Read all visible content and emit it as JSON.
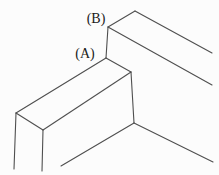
{
  "figure": {
    "background_color": "#fcfcfc",
    "stroke_color": "#4f4f4f",
    "label_color": "#1a1a1a",
    "labels": [
      {
        "text": "(B)",
        "x": 96,
        "y": 23,
        "name": "point-label-B"
      },
      {
        "text": "(A)",
        "x": 85,
        "y": 58,
        "name": "point-label-A"
      }
    ],
    "segments": [
      {
        "name": "upper-slab-back-top-edge",
        "x1": 135,
        "y1": 11,
        "x2": 212,
        "y2": 53
      },
      {
        "name": "upper-slab-left-top-edge",
        "x1": 108,
        "y1": 27,
        "x2": 135,
        "y2": 11
      },
      {
        "name": "upper-slab-front-top-edge",
        "x1": 108,
        "y1": 27,
        "x2": 212,
        "y2": 85
      },
      {
        "name": "edge-B-to-A-vertical",
        "x1": 108,
        "y1": 27,
        "x2": 106,
        "y2": 58
      },
      {
        "name": "lower-slab-back-top-edge",
        "x1": 106,
        "y1": 58,
        "x2": 16,
        "y2": 113
      },
      {
        "name": "lower-slab-right-top-edge",
        "x1": 106,
        "y1": 58,
        "x2": 131,
        "y2": 72
      },
      {
        "name": "lower-slab-left-top-edge",
        "x1": 16,
        "y1": 113,
        "x2": 43,
        "y2": 130
      },
      {
        "name": "lower-slab-front-top-edge",
        "x1": 43,
        "y1": 130,
        "x2": 131,
        "y2": 72
      },
      {
        "name": "lower-slab-back-vertical",
        "x1": 16,
        "y1": 113,
        "x2": 14,
        "y2": 169
      },
      {
        "name": "lower-slab-front-vertical",
        "x1": 43,
        "y1": 130,
        "x2": 42,
        "y2": 171
      },
      {
        "name": "lower-slab-right-vertical",
        "x1": 131,
        "y1": 72,
        "x2": 134,
        "y2": 123
      },
      {
        "name": "floor-edge-left",
        "x1": 134,
        "y1": 123,
        "x2": 61,
        "y2": 166
      },
      {
        "name": "floor-edge-right",
        "x1": 134,
        "y1": 123,
        "x2": 213,
        "y2": 162
      }
    ]
  }
}
